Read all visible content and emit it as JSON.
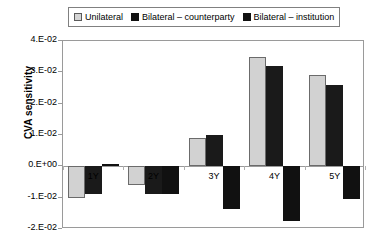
{
  "chart_data": {
    "type": "bar",
    "title": "",
    "xlabel": "",
    "ylabel": "CVA sensitivity",
    "categories": [
      "1Y",
      "2Y",
      "3Y",
      "4Y",
      "5Y"
    ],
    "ylim": [
      -0.02,
      0.04
    ],
    "ytick_values": [
      0.04,
      0.03,
      0.02,
      0.01,
      0.0,
      -0.01,
      -0.02
    ],
    "ytick_labels": [
      "4.E-02",
      "3.E-02",
      "2.E-02",
      "1.E-02",
      "0.E+00",
      "-1.E-02",
      "-2.E-02"
    ],
    "grid": false,
    "legend_position": "top",
    "series": [
      {
        "name": "Unilateral",
        "color": "#d2d2d2",
        "values": [
          -0.01,
          -0.006,
          0.009,
          0.035,
          0.029
        ]
      },
      {
        "name": "Bilateral – counterparty",
        "color": "#1a1a1a",
        "values": [
          -0.0087,
          -0.0087,
          0.01,
          0.032,
          0.026
        ]
      },
      {
        "name": "Bilateral – institution",
        "color": "#111111",
        "values": [
          0.0007,
          -0.0087,
          -0.0137,
          -0.0175,
          -0.0105
        ]
      }
    ]
  },
  "legend": {
    "items": [
      {
        "label": "Unilateral",
        "swatch": "unilateral-swatch-icon"
      },
      {
        "label": "Bilateral – counterparty",
        "swatch": "counterparty-swatch-icon"
      },
      {
        "label": "Bilateral – institution",
        "swatch": "institution-swatch-icon"
      }
    ]
  },
  "axes": {
    "y_title": "CVA sensitivity"
  }
}
